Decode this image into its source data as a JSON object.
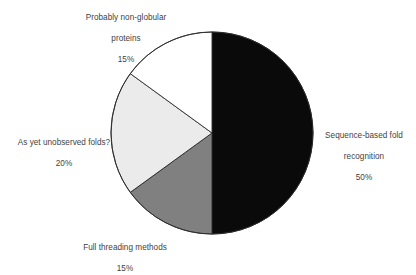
{
  "chart_data": {
    "type": "pie",
    "title": "",
    "subtitle": "",
    "xlabel": "",
    "ylabel": "",
    "legend_position": "outside-labels",
    "grid": false,
    "total": 100,
    "units": "%",
    "start_angle_deg": 0,
    "direction": "clockwise",
    "categories": [
      "Sequence-based fold recognition",
      "Full threading methods",
      "As yet unobserved folds?",
      "Probably non-globular proteins"
    ],
    "values": [
      50,
      15,
      20,
      15
    ],
    "slices": [
      {
        "label": "Sequence-based fold recognition",
        "label_line1": "Sequence-based fold",
        "label_line2": "recognition",
        "value": 50,
        "value_text": "50%",
        "color": "#0a0a0a",
        "stroke": "#1a1a1a",
        "start_deg": 0,
        "end_deg": 180,
        "label_position": "right"
      },
      {
        "label": "Full threading methods",
        "label_line1": "Full threading methods",
        "label_line2": "",
        "value": 15,
        "value_text": "15%",
        "color": "#808080",
        "stroke": "#2b2b2b",
        "start_deg": 180,
        "end_deg": 234,
        "label_position": "bottom"
      },
      {
        "label": "As yet unobserved folds?",
        "label_line1": "As yet unobserved folds?",
        "label_line2": "",
        "value": 20,
        "value_text": "20%",
        "color": "#ebebeb",
        "stroke": "#2b2b2b",
        "start_deg": 234,
        "end_deg": 306,
        "label_position": "left"
      },
      {
        "label": "Probably non-globular proteins",
        "label_line1": "Probably non-globular",
        "label_line2": "proteins",
        "value": 15,
        "value_text": "15%",
        "color": "#ffffff",
        "stroke": "#2b2b2b",
        "start_deg": 306,
        "end_deg": 360,
        "label_position": "top"
      }
    ],
    "geometry": {
      "center_x": 212,
      "center_y": 133,
      "radius": 101
    },
    "background": "#ffffff"
  }
}
